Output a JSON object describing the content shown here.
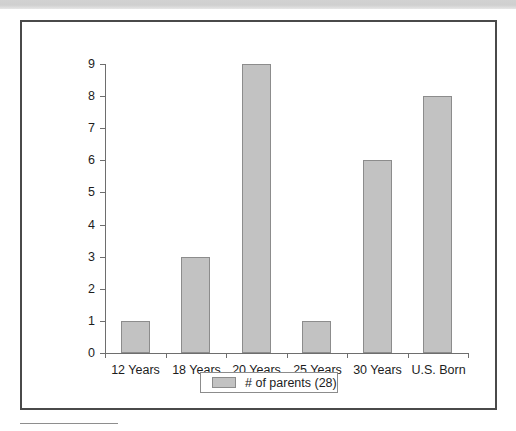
{
  "page": {
    "top_band": "scan-band",
    "footnote_rule": "footnote-separator"
  },
  "chart_data": {
    "type": "bar",
    "title": "",
    "subtitle": "",
    "xlabel": "",
    "ylabel": "",
    "categories": [
      "12 Years",
      "18 Years",
      "20 Years",
      "25 Years",
      "30 Years",
      "U.S. Born"
    ],
    "values": [
      1,
      3,
      9,
      1,
      6,
      8
    ],
    "series": [
      {
        "name": "# of parents (28)",
        "values": [
          1,
          3,
          9,
          1,
          6,
          8
        ]
      }
    ],
    "ylim": [
      0,
      9
    ],
    "yticks": [
      0,
      1,
      2,
      3,
      4,
      5,
      6,
      7,
      8,
      9
    ],
    "ytick_labels": [
      "0",
      "1",
      "2",
      "3",
      "4",
      "5",
      "6",
      "7",
      "8",
      "9"
    ],
    "grid": false,
    "legend": {
      "position": "bottom-center",
      "entries": [
        {
          "label": "# of parents (28)",
          "color": "#c2c2c2"
        }
      ]
    },
    "colors": {
      "bar_fill": "#c2c2c2",
      "bar_border": "#8c8c8c",
      "axis": "#6e6e6e",
      "frame": "#4a4a4a",
      "text": "#1d1d1d",
      "band": "#d2d2d2"
    }
  }
}
